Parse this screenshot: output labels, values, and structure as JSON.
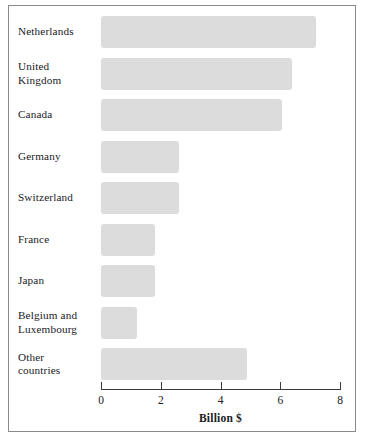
{
  "chart_data": {
    "type": "bar",
    "orientation": "horizontal",
    "title": "",
    "xlabel": "Billion $",
    "ylabel": "",
    "xlim": [
      0,
      8
    ],
    "xticks": [
      0,
      2,
      4,
      6,
      8
    ],
    "xtick_labels": [
      "0",
      "2",
      "4",
      "6",
      "8"
    ],
    "grid": false,
    "legend": null,
    "bar_color": "#dcdcdc",
    "axis_color": "#3b3b38",
    "frame_color": "#8a8a86",
    "text_color": "#20201e",
    "categories": [
      "Netherlands",
      "United Kingdom",
      "Canada",
      "Germany",
      "Switzerland",
      "France",
      "Japan",
      "Belgium and Luxembourg",
      "Other countries"
    ],
    "category_label_lines": [
      [
        "Netherlands"
      ],
      [
        "United",
        "Kingdom"
      ],
      [
        "Canada"
      ],
      [
        "Germany"
      ],
      [
        "Switzerland"
      ],
      [
        "France"
      ],
      [
        "Japan"
      ],
      [
        "Belgium and",
        "Luxembourg"
      ],
      [
        "Other",
        "countries"
      ]
    ],
    "values": [
      7.2,
      6.4,
      6.05,
      2.6,
      2.6,
      1.8,
      1.8,
      1.2,
      4.9
    ]
  },
  "axis": {
    "title": "Billion $",
    "ticks": [
      {
        "value": "0"
      },
      {
        "value": "2"
      },
      {
        "value": "4"
      },
      {
        "value": "6"
      },
      {
        "value": "8"
      }
    ]
  },
  "bars": [
    {
      "label_line1": "Netherlands",
      "label_line2": "",
      "value": 7.2
    },
    {
      "label_line1": "United",
      "label_line2": "Kingdom",
      "value": 6.4
    },
    {
      "label_line1": "Canada",
      "label_line2": "",
      "value": 6.05
    },
    {
      "label_line1": "Germany",
      "label_line2": "",
      "value": 2.6
    },
    {
      "label_line1": "Switzerland",
      "label_line2": "",
      "value": 2.6
    },
    {
      "label_line1": "France",
      "label_line2": "",
      "value": 1.8
    },
    {
      "label_line1": "Japan",
      "label_line2": "",
      "value": 1.8
    },
    {
      "label_line1": "Belgium and",
      "label_line2": "Luxembourg",
      "value": 1.2
    },
    {
      "label_line1": "Other",
      "label_line2": "countries",
      "value": 4.9
    }
  ]
}
